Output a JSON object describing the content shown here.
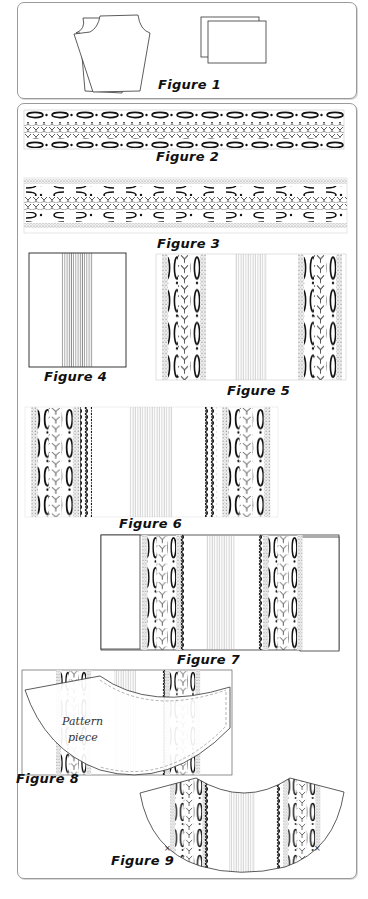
{
  "figures": {
    "fig1": {
      "caption": "Figure 1"
    },
    "fig2": {
      "caption": "Figure 2"
    },
    "fig3": {
      "caption": "Figure 3"
    },
    "fig4": {
      "caption": "Figure 4"
    },
    "fig5": {
      "caption": "Figure 5"
    },
    "fig6": {
      "caption": "Figure 6"
    },
    "fig7": {
      "caption": "Figure 7"
    },
    "fig8": {
      "caption": "Figure 8",
      "label_line1": "Pattern",
      "label_line2": "piece"
    },
    "fig9": {
      "caption": "Figure 9"
    }
  },
  "colors": {
    "line": "#222222",
    "panel_border": "#9a9a9a",
    "lace_gray": "#bdbdbd"
  }
}
